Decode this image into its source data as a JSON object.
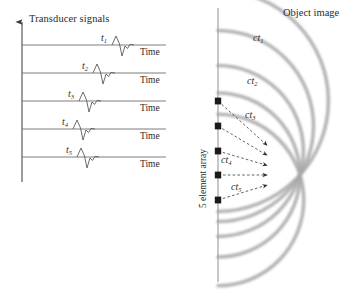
{
  "figure": {
    "left_panel": {
      "axis_title": "Transducer signals",
      "time_axis_label": "Time",
      "traces": [
        {
          "label": "t",
          "sub": "1",
          "baseline_y": 45,
          "pulse_x": 118,
          "label_x": 101,
          "label_y": 33,
          "time_x": 140,
          "time_y": 48
        },
        {
          "label": "t",
          "sub": "2",
          "baseline_y": 73,
          "pulse_x": 99,
          "label_x": 82,
          "label_y": 61,
          "time_x": 140,
          "time_y": 76
        },
        {
          "label": "t",
          "sub": "3",
          "baseline_y": 101,
          "pulse_x": 85,
          "label_x": 68,
          "label_y": 89,
          "time_x": 140,
          "time_y": 104
        },
        {
          "label": "t",
          "sub": "4",
          "baseline_y": 129,
          "pulse_x": 79,
          "label_x": 62,
          "label_y": 117,
          "time_x": 140,
          "time_y": 132
        },
        {
          "label": "t",
          "sub": "5",
          "baseline_y": 157,
          "pulse_x": 83,
          "label_x": 66,
          "label_y": 145,
          "time_x": 140,
          "time_y": 160
        }
      ]
    },
    "right_panel": {
      "object_image_label": "Object image",
      "array_label": "5 element array",
      "array_line_x": 33,
      "focal_point": {
        "x": 115,
        "y": 175
      },
      "elements": [
        {
          "index": 1,
          "y": 101
        },
        {
          "index": 2,
          "y": 126
        },
        {
          "index": 3,
          "y": 151
        },
        {
          "index": 4,
          "y": 175
        },
        {
          "index": 5,
          "y": 200
        }
      ],
      "ct_labels": [
        {
          "label": "ct",
          "sub": "1",
          "x": 68,
          "y": 33
        },
        {
          "label": "ct",
          "sub": "2",
          "x": 62,
          "y": 76
        },
        {
          "label": "ct",
          "sub": "3",
          "x": 60,
          "y": 110
        },
        {
          "label": "ct",
          "sub": "4",
          "x": 36,
          "y": 155
        },
        {
          "label": "ct",
          "sub": "5",
          "x": 46,
          "y": 182
        }
      ]
    }
  },
  "colors": {
    "arc_gray": "#a8a8a8",
    "line_dark": "#555555",
    "text": "#2b2b2b",
    "element_marker": "#1a1a1a"
  }
}
